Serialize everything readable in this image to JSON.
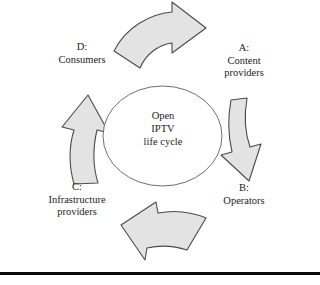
{
  "figure": {
    "name": "Open IPTV life cycle diagram",
    "center": {
      "line1": "Open",
      "line2": "IPTV",
      "line3": "life cycle"
    },
    "stages": [
      {
        "key": "A",
        "marker": "A:",
        "line1": "Content",
        "line2": "providers",
        "position": "top-right"
      },
      {
        "key": "B",
        "marker": "B:",
        "line1": "Operators",
        "line2": "",
        "position": "bottom-right"
      },
      {
        "key": "C",
        "marker": "C:",
        "line1": "Infrastructure",
        "line2": "providers",
        "position": "bottom-left"
      },
      {
        "key": "D",
        "marker": "D:",
        "line1": "Consumers",
        "line2": "",
        "position": "top-left"
      }
    ],
    "arrows": [
      {
        "name": "top-arrow",
        "direction": "right",
        "from": "D",
        "to": "A"
      },
      {
        "name": "right-arrow",
        "direction": "down",
        "from": "A",
        "to": "B"
      },
      {
        "name": "bottom-arrow",
        "direction": "left",
        "from": "B",
        "to": "C"
      },
      {
        "name": "left-arrow",
        "direction": "up",
        "from": "C",
        "to": "D"
      }
    ],
    "colors": {
      "arrow_fill": "#e3e3e3",
      "arrow_stroke": "#4a4a4a",
      "ellipse_stroke": "#6e6e6e",
      "ellipse_fill": "#ffffff",
      "text": "#1c1c1c",
      "rule": "#0a0a0a",
      "background": "#ffffff"
    }
  }
}
